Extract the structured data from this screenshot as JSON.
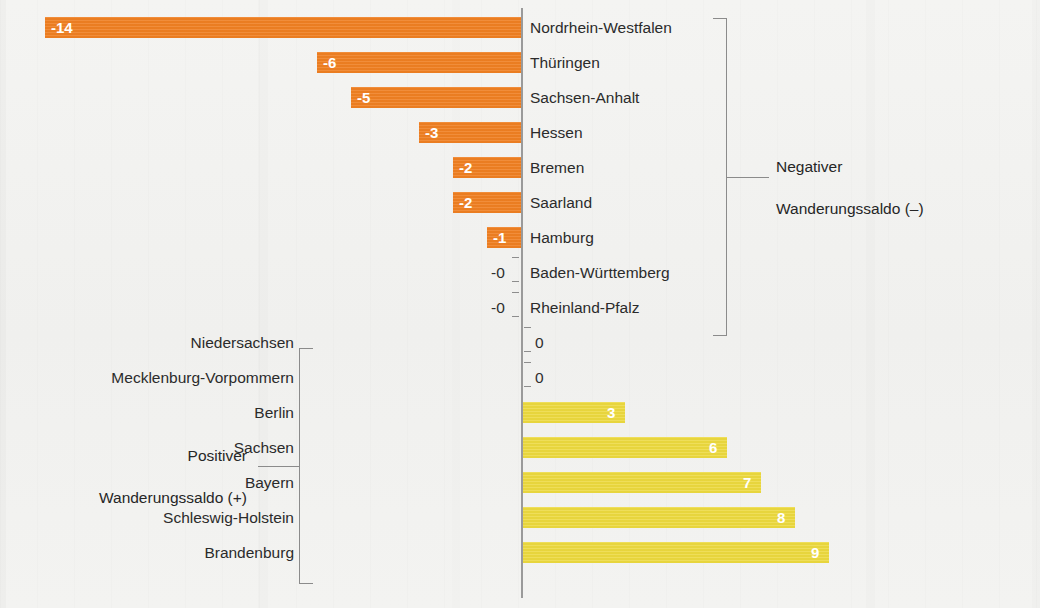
{
  "chart_data": {
    "type": "bar",
    "title": "",
    "subtitle": "",
    "xlabel": "",
    "ylabel": "",
    "orientation": "horizontal",
    "grid": false,
    "xlim": [
      -14,
      9
    ],
    "zero_at": "center",
    "unit_px_per_value": 34,
    "categories": [
      "Nordrhein-Westfalen",
      "Thüringen",
      "Sachsen-Anhalt",
      "Hessen",
      "Bremen",
      "Saarland",
      "Hamburg",
      "Baden-Württemberg",
      "Rheinland-Pfalz",
      "Niedersachsen",
      "Mecklenburg-Vorpommern",
      "Berlin",
      "Sachsen",
      "Bayern",
      "Schleswig-Holstein",
      "Brandenburg"
    ],
    "values": [
      -14,
      -6,
      -5,
      -3,
      -2,
      -2,
      -1,
      0,
      0,
      0,
      0,
      3,
      6,
      7,
      8,
      9
    ],
    "value_labels": [
      "-14",
      "-6",
      "-5",
      "-3",
      "-2",
      "-2",
      "-1",
      "-0",
      "-0",
      "0",
      "0",
      "3",
      "6",
      "7",
      "8",
      "9"
    ],
    "series": [
      {
        "name": "Negativer Wanderungssaldo (–)",
        "color": "#ef7f22"
      },
      {
        "name": "Positiver Wanderungssaldo (+)",
        "color": "#ecd93e"
      }
    ],
    "legend_position": "inline-annotations"
  },
  "rows": [
    {
      "name": "Nordrhein-Westfalen",
      "value": -14,
      "label": "-14",
      "sign": "neg",
      "label_inside": true
    },
    {
      "name": "Thüringen",
      "value": -6,
      "label": "-6",
      "sign": "neg",
      "label_inside": true
    },
    {
      "name": "Sachsen-Anhalt",
      "value": -5,
      "label": "-5",
      "sign": "neg",
      "label_inside": true
    },
    {
      "name": "Hessen",
      "value": -3,
      "label": "-3",
      "sign": "neg",
      "label_inside": true
    },
    {
      "name": "Bremen",
      "value": -2,
      "label": "-2",
      "sign": "neg",
      "label_inside": true
    },
    {
      "name": "Saarland",
      "value": -2,
      "label": "-2",
      "sign": "neg",
      "label_inside": true
    },
    {
      "name": "Hamburg",
      "value": -1,
      "label": "-1",
      "sign": "neg",
      "label_inside": true
    },
    {
      "name": "Baden-Württemberg",
      "value": 0,
      "label": "-0",
      "sign": "neg",
      "label_inside": false
    },
    {
      "name": "Rheinland-Pfalz",
      "value": 0,
      "label": "-0",
      "sign": "neg",
      "label_inside": false
    },
    {
      "name": "Niedersachsen",
      "value": 0,
      "label": "0",
      "sign": "pos",
      "label_inside": false
    },
    {
      "name": "Mecklenburg-Vorpommern",
      "value": 0,
      "label": "0",
      "sign": "pos",
      "label_inside": false
    },
    {
      "name": "Berlin",
      "value": 3,
      "label": "3",
      "sign": "pos",
      "label_inside": true
    },
    {
      "name": "Sachsen",
      "value": 6,
      "label": "6",
      "sign": "pos",
      "label_inside": true
    },
    {
      "name": "Bayern",
      "value": 7,
      "label": "7",
      "sign": "pos",
      "label_inside": true
    },
    {
      "name": "Schleswig-Holstein",
      "value": 8,
      "label": "8",
      "sign": "pos",
      "label_inside": true
    },
    {
      "name": "Brandenburg",
      "value": 9,
      "label": "9",
      "sign": "pos",
      "label_inside": true
    }
  ],
  "annotations": {
    "negative": {
      "line1": "Negativer",
      "line2": "Wanderungssaldo (–)",
      "text": "Negativer\nWanderungssaldo (–)"
    },
    "positive": {
      "line1": "Positiver",
      "line2": "Wanderungssaldo (+)",
      "text": "Positiver\nWanderungssaldo (+)"
    }
  },
  "colors": {
    "negative_bar": "#ef7f22",
    "positive_bar": "#ecd93e",
    "axis": "#9a9a9a",
    "bracket": "#8b8b8b",
    "text": "#2b2b2b",
    "background": "#f2f2f0",
    "value_label_light": "#ffffff",
    "value_label_dark": "#2f2f2f"
  }
}
